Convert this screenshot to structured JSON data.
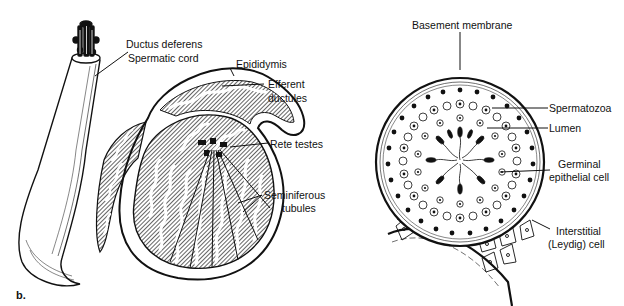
{
  "figure": {
    "panel_label": "b.",
    "left_diagram": {
      "name": "testis-and-epididymis",
      "labels": {
        "ductus_deferens": "Ductus deferens",
        "spermatic_cord": "Spermatic cord",
        "epididymis": "Epididymis",
        "efferent_line1": "Efferent",
        "efferent_line2": "ductules",
        "rete_testes": "Rete testes",
        "seminiferous_line1": "Seminiferous",
        "seminiferous_line2": "tubules"
      }
    },
    "right_diagram": {
      "name": "seminiferous-tubule-cross-section",
      "labels": {
        "basement_membrane": "Basement membrane",
        "spermatozoa": "Spermatozoa",
        "lumen": "Lumen",
        "germinal_line1": "Germinal",
        "germinal_line2": "epithelial cell",
        "interstitial_line1": "Interstitial",
        "interstitial_line2": "(Leydig) cell"
      }
    }
  }
}
